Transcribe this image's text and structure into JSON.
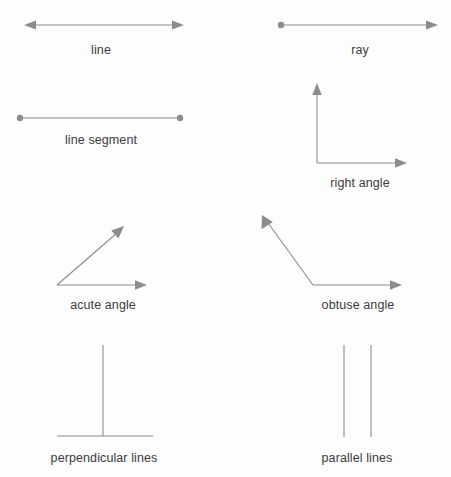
{
  "page": {
    "background_color": "#fdfdfd",
    "stroke_color": "#8c8c8c",
    "label_color": "#3b3b3b",
    "width": 451,
    "height": 477
  },
  "figures": [
    {
      "id": "line",
      "label": "line",
      "shape": "double-arrow-segment",
      "label_x": 101,
      "label_y": 52,
      "geometry": {
        "x1": 26,
        "y1": 25,
        "x2": 183,
        "y2": 25
      },
      "endpoints": {
        "start": "arrowhead",
        "end": "arrowhead"
      }
    },
    {
      "id": "ray",
      "label": "ray",
      "shape": "dot-arrow-segment",
      "label_x": 360,
      "label_y": 52,
      "geometry": {
        "x1": 281,
        "y1": 25,
        "x2": 437,
        "y2": 25
      },
      "endpoints": {
        "start": "dot",
        "end": "arrowhead"
      }
    },
    {
      "id": "line-segment",
      "label": "line segment",
      "shape": "dot-dot-segment",
      "label_x": 101,
      "label_y": 145,
      "geometry": {
        "x1": 20,
        "y1": 118,
        "x2": 180,
        "y2": 118
      },
      "endpoints": {
        "start": "dot",
        "end": "dot"
      }
    },
    {
      "id": "right-angle",
      "label": "right angle",
      "shape": "angle",
      "label_x": 360,
      "label_y": 188,
      "geometry": {
        "vertex_x": 317,
        "vertex_y": 163,
        "arm1_x": 317,
        "arm1_y": 84,
        "arm2_x": 406,
        "arm2_y": 163,
        "degrees": 90
      },
      "endpoints": {
        "arm1": "arrowhead",
        "arm2": "arrowhead"
      }
    },
    {
      "id": "acute-angle",
      "label": "acute angle",
      "shape": "angle",
      "label_x": 103,
      "label_y": 310,
      "geometry": {
        "vertex_x": 57,
        "vertex_y": 285,
        "arm1_x": 124,
        "arm1_y": 226,
        "arm2_x": 146,
        "arm2_y": 285,
        "degrees": 41
      },
      "endpoints": {
        "arm1": "arrowhead",
        "arm2": "arrowhead"
      }
    },
    {
      "id": "obtuse-angle",
      "label": "obtuse angle",
      "shape": "angle",
      "label_x": 358,
      "label_y": 310,
      "geometry": {
        "vertex_x": 313,
        "vertex_y": 285,
        "arm1_x": 262,
        "arm1_y": 215,
        "arm2_x": 401,
        "arm2_y": 285,
        "degrees": 126
      },
      "endpoints": {
        "arm1": "arrowhead",
        "arm2": "arrowhead"
      }
    },
    {
      "id": "perpendicular-lines",
      "label": "perpendicular lines",
      "shape": "perpendicular-pair",
      "label_x": 104,
      "label_y": 463,
      "geometry": {
        "vertical_x": 103,
        "vertical_y1": 345,
        "vertical_y2": 436,
        "horizontal_y": 436,
        "horizontal_x1": 57,
        "horizontal_x2": 153
      },
      "endpoints": {
        "start": "plain",
        "end": "plain"
      }
    },
    {
      "id": "parallel-lines",
      "label": "parallel lines",
      "shape": "parallel-pair",
      "label_x": 357,
      "label_y": 463,
      "geometry": {
        "line1_x": 344,
        "line2_x": 371,
        "y1": 345,
        "y2": 437
      },
      "endpoints": {
        "start": "plain",
        "end": "plain"
      }
    }
  ]
}
